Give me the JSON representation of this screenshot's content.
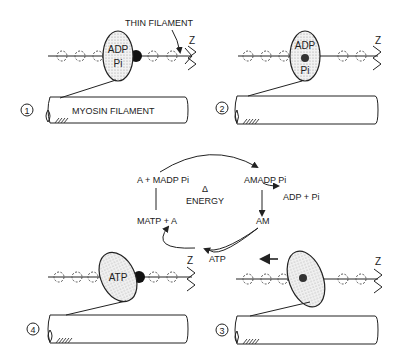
{
  "labels": {
    "thin_filament": "THIN FILAMENT",
    "myosin_filament": "MYOSIN FILAMENT",
    "z": "Z"
  },
  "panels": [
    {
      "number": "1",
      "head_label_top": "ADP",
      "head_label_bottom": "Pi"
    },
    {
      "number": "2",
      "head_label_top": "ADP",
      "head_label_bottom": "Pi"
    },
    {
      "number": "3",
      "head_label_top": "",
      "head_label_bottom": ""
    },
    {
      "number": "4",
      "head_label_top": "ATP",
      "head_label_bottom": ""
    }
  ],
  "cycle": {
    "center_top": "Δ",
    "center_bottom": "ENERGY",
    "states": {
      "top_left": "A + MADP  Pi",
      "top_right": "AMADP  Pi",
      "right_product": "ADP + Pi",
      "bottom_right": "AM",
      "bottom_input": "ATP",
      "bottom_left": "MATP + A"
    }
  },
  "colors": {
    "ink": "#222222",
    "stipple": "#cfcfcf",
    "background": "#ffffff"
  }
}
